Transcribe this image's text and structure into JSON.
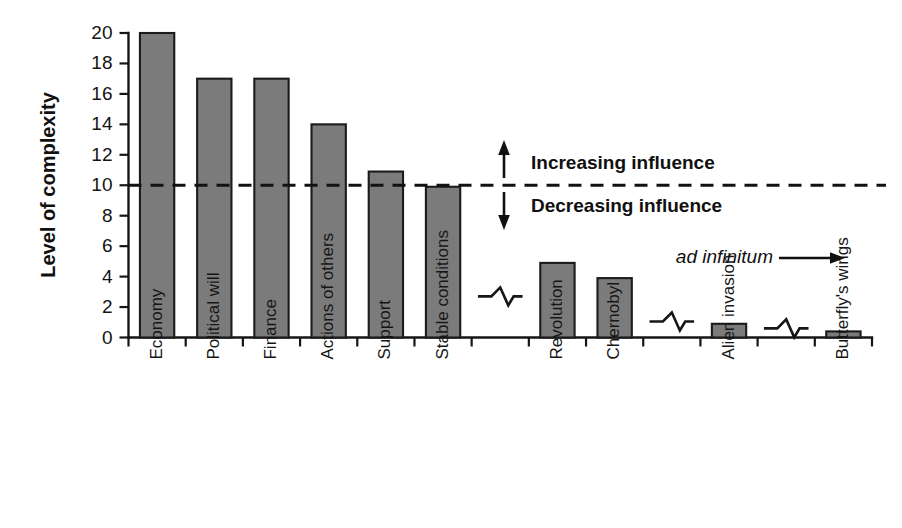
{
  "chart_data": {
    "type": "bar",
    "title": "",
    "xlabel": "",
    "ylabel": "Level of complexity",
    "ylim": [
      0,
      20
    ],
    "ytick_labels": [
      "0",
      "2",
      "4",
      "6",
      "8",
      "10",
      "12",
      "14",
      "16",
      "18",
      "20"
    ],
    "ytick_values": [
      0,
      2,
      4,
      6,
      8,
      10,
      12,
      14,
      16,
      18,
      20
    ],
    "grid": false,
    "legend": "none",
    "categories": [
      "Economy",
      "Political will",
      "Finance",
      "Actions of others",
      "Support",
      "Stable conditions",
      "Revolution",
      "Chernobyl",
      "Alien invasion",
      "Butterfly's wings"
    ],
    "values": [
      20,
      17,
      17,
      14,
      10.9,
      9.9,
      4.9,
      3.9,
      0.9,
      0.4
    ],
    "slot_index": [
      0,
      1,
      2,
      3,
      4,
      5,
      7,
      8,
      10,
      12
    ],
    "slot_count": 13,
    "break_symbol_slots": [
      6,
      9,
      11
    ],
    "break_symbol_values": [
      2.7,
      1.05,
      0.6
    ],
    "bar_color": "#7b7b7b",
    "bar_edge_color": "#1b1b1b",
    "threshold": {
      "value": 10,
      "style": "dashed",
      "color": "#121212"
    },
    "annotations": [
      {
        "name": "increasing-influence",
        "text": "Increasing influence",
        "value": 13.2,
        "direction": "up"
      },
      {
        "name": "decreasing-influence",
        "text": "Decreasing influence",
        "value": 7.6,
        "direction": "down"
      },
      {
        "name": "ad-infinitum",
        "text": "ad infinitum",
        "value": 4.6,
        "direction": "right"
      }
    ]
  }
}
